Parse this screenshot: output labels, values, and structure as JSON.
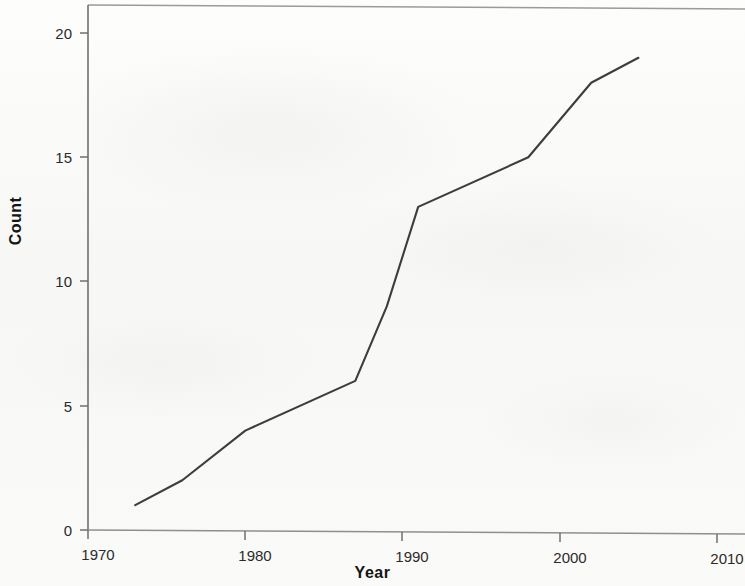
{
  "chart_data": {
    "type": "line",
    "title": "",
    "subtitle": "",
    "xlabel": "Year",
    "ylabel": "Count",
    "xlim": [
      1967.5,
      2012
    ],
    "ylim": [
      0,
      21
    ],
    "xticks": [
      1970,
      1980,
      1990,
      2000,
      2010
    ],
    "xtick_labels": [
      "1970",
      "1980",
      "1990",
      "2000",
      "2010"
    ],
    "yticks": [
      0,
      5,
      10,
      15,
      20
    ],
    "ytick_labels": [
      "0",
      "5",
      "10",
      "15",
      "20"
    ],
    "grid": false,
    "legend": null,
    "series": [
      {
        "name": "Count",
        "color": "#3d3d3d",
        "x": [
          1973,
          1976,
          1980,
          1987,
          1989,
          1991,
          1998,
          2002,
          2005
        ],
        "values": [
          1,
          2,
          4,
          6,
          9,
          13,
          15,
          18,
          19
        ]
      }
    ]
  },
  "axes": {
    "y_title": "Count",
    "x_title": "Year",
    "y_tick_labels": [
      "20",
      "15",
      "10",
      "5",
      "0"
    ],
    "x_tick_labels": [
      "1970",
      "1980",
      "1990",
      "2000",
      "2010"
    ]
  },
  "style": {
    "line_color": "#3d3d3d",
    "axis_color": "#8a8a8a",
    "text_color": "#2b2b2b",
    "background": "#fbfbfa"
  }
}
